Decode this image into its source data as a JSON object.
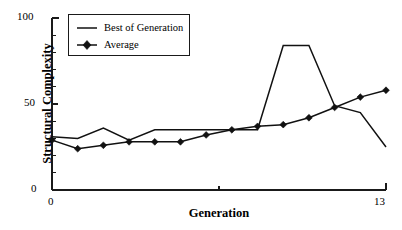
{
  "chart_data": {
    "type": "line",
    "title": "",
    "xlabel": "Generation",
    "ylabel": "Structural Complexity",
    "xlim": [
      0,
      13
    ],
    "ylim": [
      0,
      100
    ],
    "x": [
      0,
      1,
      2,
      3,
      4,
      5,
      6,
      7,
      8,
      9,
      10,
      11,
      12,
      13
    ],
    "xticks": [
      0,
      13
    ],
    "xtick_labels": [
      "0",
      "13"
    ],
    "x_minor_ticks": [
      6.5
    ],
    "yticks": [
      0,
      50,
      100
    ],
    "ytick_labels": [
      "0",
      "50",
      "100"
    ],
    "y_minor_ticks": [
      10,
      20,
      30,
      40,
      60,
      70,
      80,
      90
    ],
    "grid": false,
    "legend_position": "upper-left",
    "series": [
      {
        "name": "Best of Generation",
        "marker": "none",
        "values": [
          31,
          30,
          36,
          29,
          35,
          35,
          35,
          35,
          35,
          84,
          84,
          49,
          45,
          25
        ]
      },
      {
        "name": "Average",
        "marker": "diamond",
        "values": [
          29,
          24,
          26,
          28,
          28,
          28,
          32,
          35,
          37,
          38,
          42,
          48,
          54,
          58
        ]
      }
    ]
  },
  "axes": {
    "y_title": "Structural Complexity",
    "x_title": "Generation",
    "y_tick_labels": [
      "100",
      "50",
      "0"
    ],
    "x_tick_labels": [
      "0",
      "13"
    ]
  },
  "legend": {
    "entries": [
      {
        "label": "Best of Generation",
        "marker": "line"
      },
      {
        "label": "Average",
        "marker": "line-diamond"
      }
    ]
  },
  "colors": {
    "line": "#111111",
    "axis": "#1a1a1a",
    "background": "#ffffff"
  }
}
